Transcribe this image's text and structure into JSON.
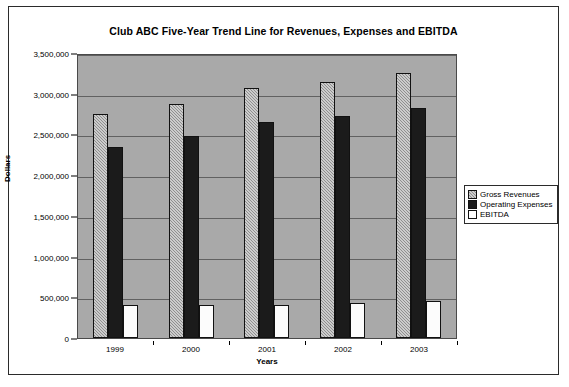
{
  "chart_data": {
    "type": "bar",
    "title": "Club ABC Five-Year Trend Line for Revenues, Expenses and EBITDA",
    "xlabel": "Years",
    "ylabel": "Dollars",
    "categories": [
      "1999",
      "2000",
      "2001",
      "2002",
      "2003"
    ],
    "series": [
      {
        "name": "Gross Revenues",
        "values": [
          2750000,
          2875000,
          3075000,
          3150000,
          3250000
        ],
        "color": "#8f8f8f"
      },
      {
        "name": "Operating Expenses",
        "values": [
          2350000,
          2475000,
          2650000,
          2725000,
          2825000
        ],
        "color": "#1b1b1b"
      },
      {
        "name": "EBITDA",
        "values": [
          400000,
          400000,
          400000,
          425000,
          450000
        ],
        "color": "#ffffff"
      }
    ],
    "ylim": [
      0,
      3500000
    ],
    "yticks": [
      "0",
      "500,000",
      "1,000,000",
      "1,500,000",
      "2,000,000",
      "2,500,000",
      "3,000,000",
      "3,500,000"
    ],
    "ytick_values": [
      0,
      500000,
      1000000,
      1500000,
      2000000,
      2500000,
      3000000,
      3500000
    ],
    "grid": true,
    "legend_position": "right",
    "plot_background": "#a9a9a9"
  }
}
